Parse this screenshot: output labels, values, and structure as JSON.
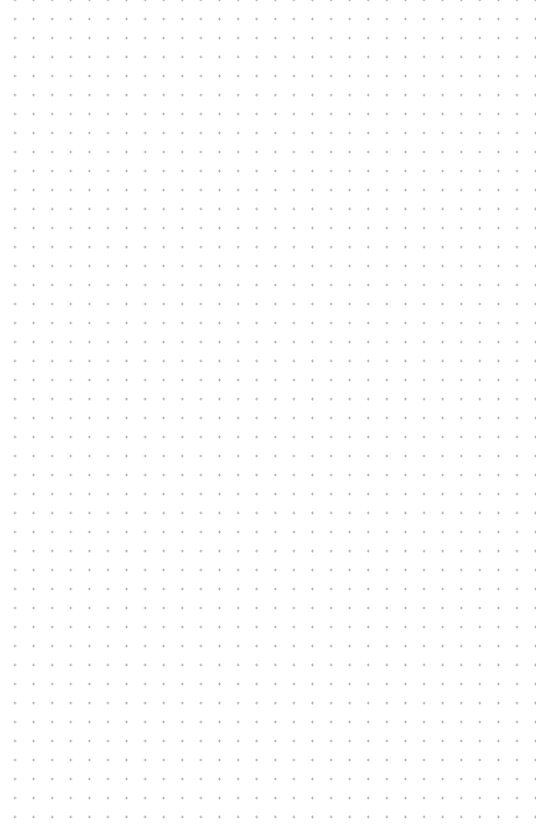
{
  "canvas": {
    "type": "dot-grid",
    "background_color": "#ffffff",
    "dot_color": "#a8a8a8",
    "dot_spacing_x": 18.6,
    "dot_spacing_y": 19,
    "columns": 28,
    "rows": 43
  }
}
